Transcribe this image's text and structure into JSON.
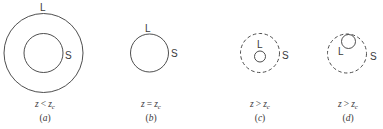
{
  "colors": {
    "stroke": "#3a3a3a",
    "background": "#ffffff"
  },
  "panels": [
    {
      "id": "a",
      "caption": "(a)",
      "caption_letter": "a",
      "relation_lhs": "z",
      "relation_op": "<",
      "relation_rhs": "z",
      "relation_sub": "c",
      "outer_label": "L",
      "inner_label": "S",
      "outer_style": "solid",
      "inner_style": "solid"
    },
    {
      "id": "b",
      "caption": "(b)",
      "caption_letter": "b",
      "relation_lhs": "z",
      "relation_op": "=",
      "relation_rhs": "z",
      "relation_sub": "c",
      "outer_label": "L",
      "inner_label": "S",
      "outer_style": "solid"
    },
    {
      "id": "c",
      "caption": "(c)",
      "caption_letter": "c",
      "relation_lhs": "z",
      "relation_op": ">",
      "relation_rhs": "z",
      "relation_sub": "c",
      "outer_label": "S",
      "inner_label": "L",
      "outer_style": "dashed",
      "inner_style": "solid"
    },
    {
      "id": "d",
      "caption": "(d)",
      "caption_letter": "d",
      "relation_lhs": "z",
      "relation_op": ">",
      "relation_rhs": "z",
      "relation_sub": "c",
      "outer_label": "S",
      "inner_label": "L",
      "outer_style": "dashed",
      "inner_style": "solid"
    }
  ]
}
